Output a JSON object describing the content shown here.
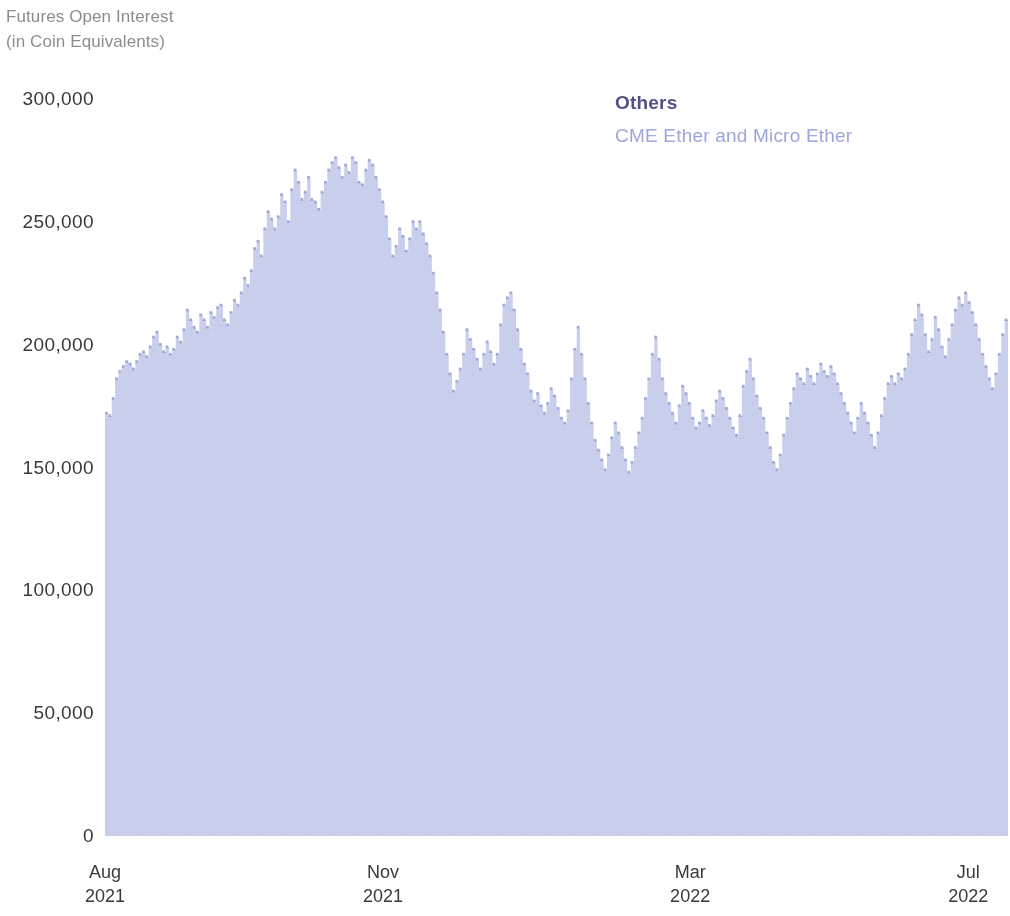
{
  "title": {
    "line1": "Futures Open Interest",
    "line2": "(in Coin Equivalents)"
  },
  "legend": {
    "others": "Others",
    "cme": "CME Ether and Micro Ether"
  },
  "colors": {
    "area_fill": "#c6cceb",
    "area_top_edge": "#8d96c9",
    "others_label": "#4c4c7e",
    "cme_label": "#97a2d9",
    "axis_text": "#3a3a3a",
    "title_text": "#8d8d8d",
    "background": "#ffffff"
  },
  "axes": {
    "y_ticks": [
      "0",
      "50,000",
      "100,000",
      "150,000",
      "200,000",
      "250,000",
      "300,000"
    ],
    "y_tick_values": [
      0,
      50000,
      100000,
      150000,
      200000,
      250000,
      300000
    ],
    "x_ticks": [
      {
        "month": "Aug",
        "year": "2021"
      },
      {
        "month": "Nov",
        "year": "2021"
      },
      {
        "month": "Mar",
        "year": "2022"
      },
      {
        "month": "Jul",
        "year": "2022"
      }
    ]
  },
  "chart_data": {
    "type": "area",
    "title": "Futures Open Interest (in Coin Equivalents)",
    "xlabel": "",
    "ylabel": "",
    "ylim": [
      0,
      300000
    ],
    "grid": false,
    "legend_position": "top-right",
    "legend_entries": [
      "Others",
      "CME Ether and Micro Ether"
    ],
    "x_tick_labels": [
      "Aug 2021",
      "Nov 2021",
      "Mar 2022",
      "Jul 2022"
    ],
    "x_tick_positions": [
      0,
      0.308,
      0.648,
      0.956
    ],
    "series": [
      {
        "name": "Others",
        "values": [
          172000,
          171000,
          178000,
          186000,
          189000,
          191000,
          193000,
          192000,
          190000,
          193000,
          196000,
          197000,
          195000,
          199000,
          203000,
          205000,
          200000,
          197000,
          199000,
          196000,
          198000,
          203000,
          201000,
          206000,
          214000,
          210000,
          207000,
          205000,
          212000,
          210000,
          207000,
          213000,
          211000,
          215000,
          216000,
          210000,
          208000,
          213000,
          218000,
          216000,
          221000,
          227000,
          224000,
          230000,
          239000,
          242000,
          236000,
          247000,
          254000,
          251000,
          247000,
          252000,
          261000,
          258000,
          250000,
          263000,
          271000,
          266000,
          259000,
          262000,
          268000,
          259000,
          258000,
          255000,
          262000,
          266000,
          271000,
          274000,
          276000,
          272000,
          268000,
          273000,
          270000,
          276000,
          274000,
          266000,
          265000,
          271000,
          275000,
          273000,
          268000,
          263000,
          258000,
          252000,
          243000,
          236000,
          240000,
          247000,
          244000,
          238000,
          243000,
          250000,
          247000,
          250000,
          245000,
          241000,
          236000,
          229000,
          221000,
          214000,
          205000,
          196000,
          188000,
          181000,
          185000,
          190000,
          196000,
          206000,
          202000,
          198000,
          194000,
          190000,
          196000,
          201000,
          197000,
          192000,
          196000,
          208000,
          216000,
          219000,
          221000,
          214000,
          206000,
          198000,
          192000,
          188000,
          181000,
          177000,
          180000,
          175000,
          172000,
          176000,
          182000,
          179000,
          174000,
          170000,
          168000,
          173000,
          186000,
          198000,
          207000,
          196000,
          186000,
          176000,
          168000,
          161000,
          157000,
          153000,
          149000,
          155000,
          162000,
          168000,
          164000,
          158000,
          153000,
          148000,
          152000,
          158000,
          164000,
          170000,
          178000,
          186000,
          196000,
          203000,
          194000,
          186000,
          180000,
          176000,
          172000,
          168000,
          175000,
          183000,
          180000,
          176000,
          170000,
          166000,
          168000,
          173000,
          170000,
          167000,
          171000,
          177000,
          181000,
          178000,
          174000,
          170000,
          166000,
          163000,
          171000,
          183000,
          189000,
          194000,
          186000,
          179000,
          174000,
          170000,
          164000,
          158000,
          152000,
          149000,
          155000,
          163000,
          170000,
          176000,
          182000,
          188000,
          186000,
          184000,
          190000,
          187000,
          184000,
          188000,
          192000,
          189000,
          187000,
          191000,
          188000,
          184000,
          180000,
          176000,
          172000,
          168000,
          164000,
          170000,
          176000,
          172000,
          168000,
          163000,
          158000,
          164000,
          171000,
          178000,
          184000,
          187000,
          184000,
          188000,
          186000,
          190000,
          196000,
          204000,
          210000,
          216000,
          212000,
          204000,
          197000,
          202000,
          211000,
          206000,
          199000,
          195000,
          202000,
          208000,
          214000,
          219000,
          216000,
          221000,
          217000,
          213000,
          208000,
          202000,
          196000,
          191000,
          186000,
          182000,
          188000,
          196000,
          204000,
          210000
        ]
      },
      {
        "name": "CME Ether and Micro Ether",
        "values": [
          0,
          0,
          0,
          0,
          0,
          0,
          0,
          0,
          0,
          0,
          0,
          0,
          0,
          0,
          0,
          0,
          0,
          0,
          0,
          0,
          0,
          0,
          0,
          0,
          0,
          0,
          0,
          0,
          0,
          0,
          0,
          0,
          0,
          0,
          0,
          0,
          0,
          0,
          0,
          0,
          0,
          0,
          0,
          0,
          0,
          0,
          0,
          0,
          0,
          0,
          0,
          0,
          0,
          0,
          0,
          0,
          0,
          0,
          0,
          0,
          0,
          0,
          0,
          0,
          0,
          0,
          0,
          0,
          0,
          0,
          0,
          0,
          0,
          0,
          0,
          0,
          0,
          0,
          0,
          0,
          0,
          0,
          0,
          0,
          0,
          0,
          0,
          0,
          0,
          0,
          0,
          0,
          0,
          0,
          0,
          0,
          0,
          0,
          0,
          0,
          0,
          0,
          0,
          0,
          0,
          0,
          0,
          0,
          0,
          0,
          0,
          0,
          0,
          0,
          0,
          0,
          0,
          0,
          0,
          0,
          0,
          0,
          0,
          0,
          0,
          0,
          0,
          0,
          0,
          0,
          0,
          0,
          0,
          0,
          0,
          0,
          0,
          0,
          0,
          0,
          0,
          0,
          0,
          0,
          0,
          0,
          0,
          0,
          0,
          0,
          0,
          0,
          0,
          0,
          0,
          0,
          0,
          0,
          0,
          0,
          0,
          0,
          0,
          0,
          0,
          0,
          0,
          0,
          0,
          0,
          0,
          0,
          0,
          0,
          0,
          0,
          0,
          0,
          0,
          0,
          0,
          0,
          0,
          0,
          0,
          0,
          0,
          0,
          0,
          0,
          0,
          0,
          0,
          0,
          0,
          0,
          0,
          0,
          0,
          0,
          0,
          0,
          0,
          0,
          0,
          0,
          0,
          0,
          0,
          0,
          0,
          0,
          0,
          0,
          0,
          0,
          0,
          0,
          0,
          0,
          0,
          0,
          0,
          0,
          0,
          0,
          0,
          0,
          0,
          0,
          0,
          0,
          0,
          0,
          0,
          0,
          0,
          0,
          0,
          0,
          0,
          0,
          0,
          0,
          0,
          0,
          0,
          0,
          0,
          0,
          0,
          0,
          0,
          0,
          0,
          0,
          0,
          0,
          0,
          0,
          0,
          0,
          0,
          0,
          0,
          0,
          0,
          0
        ]
      }
    ]
  }
}
